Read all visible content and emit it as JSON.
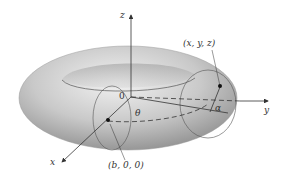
{
  "diagram": {
    "axes": {
      "z_label": "z",
      "y_label": "y",
      "x_label": "x",
      "origin_label": "0"
    },
    "points": {
      "surface_point_label": "(x, y, z)",
      "center_point_label": "(b, 0, 0)"
    },
    "angles": {
      "theta_label": "θ",
      "alpha_label": "α"
    },
    "colors": {
      "torus_light": "#e8e8e8",
      "torus_mid": "#bdbdbd",
      "torus_dark": "#8f8f8f",
      "line": "#444444",
      "background": "#ffffff"
    }
  }
}
